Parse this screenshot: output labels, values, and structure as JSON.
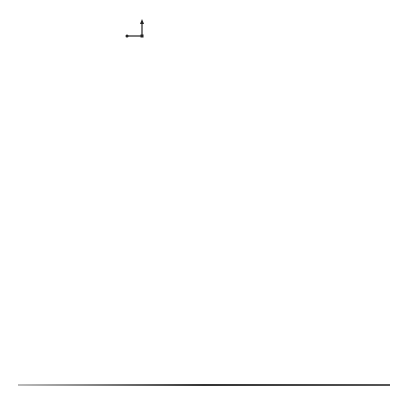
{
  "figure": {
    "axes_glyph": {
      "x": "x",
      "y": "y",
      "z": "z"
    },
    "top_row": [
      {
        "label": "a = 0.02",
        "a_symbol": "a",
        "a_value": "= 0.02",
        "cx": 72,
        "cy": 70,
        "r": 52,
        "rings": 14,
        "arrow_label": "βρmax = 1.4",
        "beta": "βρ",
        "sub": "max",
        "eq": " = 1.4"
      },
      {
        "label": "a = 0.04",
        "a_symbol": "a",
        "a_value": "= 0.04",
        "cx": 203,
        "cy": 74,
        "r": 50,
        "rings": 11,
        "arrow_label": "βρmax = 1.4",
        "beta": "βρ",
        "sub": "max",
        "eq": " = 1.4"
      },
      {
        "label": "a = 0.08",
        "a_symbol": "a",
        "a_value": "= 0.08",
        "cx": 336,
        "cy": 68,
        "r": 46,
        "rings": 7,
        "arrow_label": "βρmax = 1.4",
        "beta": "βρ",
        "sub": "max",
        "eq": " = 1.4"
      }
    ],
    "middle_row": [
      {
        "cx": 77,
        "cy": 190,
        "r": 50,
        "caption": "θ = 90°",
        "angle_labels": [
          "0",
          "30",
          "60",
          "90",
          "120",
          "150",
          "180",
          "210",
          "240",
          "270",
          "300",
          "330"
        ],
        "pattern": "circle"
      },
      {
        "cx": 206,
        "cy": 190,
        "r": 49,
        "caption": "θ = 90°",
        "angle_labels": [
          "0",
          "30",
          "60",
          "90",
          "120",
          "150",
          "180",
          "210",
          "240",
          "270",
          "300",
          "330"
        ],
        "pattern": "s-shape"
      },
      {
        "cx": 340,
        "cy": 190,
        "r": 49,
        "caption": "θ = 90°",
        "angle_labels": [
          "0",
          "30",
          "60",
          "90",
          "120",
          "150",
          "180",
          "210",
          "240",
          "270",
          "300",
          "330"
        ],
        "pattern": "butterfly"
      }
    ],
    "bottom_row": [
      {
        "cx": 74,
        "cy": 313,
        "r": 56,
        "angle_labels": [
          "0",
          "30",
          "60",
          "90",
          "120",
          "150",
          "←180",
          "-150",
          "-120",
          "-90",
          "-60",
          "-30"
        ],
        "legend": [
          "ϕ = 30°",
          "ϕ = 120°"
        ]
      },
      {
        "cx": 205,
        "cy": 313,
        "r": 56,
        "angle_labels": [
          "0",
          "30",
          "60",
          "90",
          "120",
          "150",
          "←180",
          "-150",
          "-120",
          "-90",
          "-60",
          "-30"
        ],
        "legend": [
          "ϕ = 75°",
          "ϕ = 165°"
        ]
      },
      {
        "cx": 335,
        "cy": 313,
        "r": 56,
        "angle_labels": [
          "0",
          "30",
          "60",
          "90",
          "120",
          "150",
          "←180",
          "-150",
          "-120",
          "-90",
          "-60",
          "-30"
        ],
        "legend": [
          "ϕ = 28°",
          "ϕ = 110°"
        ]
      }
    ]
  }
}
